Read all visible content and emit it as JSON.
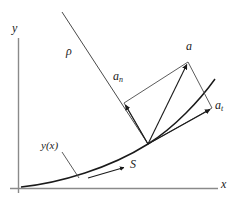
{
  "figure": {
    "background_color": "#ffffff",
    "stroke_color": "#2b2b2b",
    "axis_color": "#8a8a8a",
    "width": 238,
    "height": 204
  },
  "axes": {
    "x_label": "x",
    "y_label": "y"
  },
  "labels": {
    "rho": "ρ",
    "curve": "y(x)",
    "arc_length": "S",
    "acceleration": "a",
    "normal_acceleration_base": "a",
    "normal_acceleration_sub": "n",
    "tangential_acceleration_base": "a",
    "tangential_acceleration_sub": "t"
  },
  "geometry": {
    "origin_point": "(18, 188)",
    "contact_point": "(148, 144)",
    "acceleration_tip": "(188, 62)",
    "normal_tip": "(124, 103)",
    "tangential_tip": "(212, 108)",
    "radius_line_start": "(62, 12)"
  }
}
